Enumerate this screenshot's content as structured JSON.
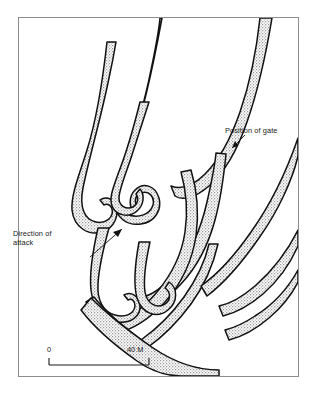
{
  "figure": {
    "kind": "archaeological-fortification-plan",
    "background_color": "#ffffff",
    "frame_border_color": "#8d8d8d"
  },
  "map": {
    "rampart_fill_color": "#d6d6d6",
    "rampart_outline_color": "#1a1a1a",
    "interior_color": "#ffffff"
  },
  "annotations": {
    "gate": {
      "label": "Position of gate",
      "leader_from": "243,133",
      "leader_to": "227,147"
    },
    "attack": {
      "label_line_1": "Direction of",
      "label_line_2": "attack",
      "arrow_from": "88,255",
      "arrow_to": "122,227"
    }
  },
  "scale_bar": {
    "min_label": "0",
    "max_label": "40 M",
    "length_px": 100,
    "unit": "M",
    "max_value": 40
  }
}
